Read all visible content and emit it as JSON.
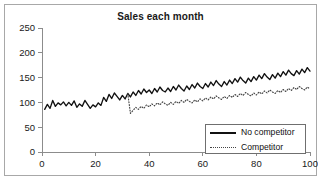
{
  "chart_data": {
    "type": "line",
    "title": "Sales each month",
    "xlabel": "",
    "ylabel": "",
    "xlim": [
      0,
      100
    ],
    "ylim": [
      0,
      250
    ],
    "xticks": [
      0,
      20,
      40,
      60,
      80,
      100
    ],
    "yticks": [
      0,
      50,
      100,
      150,
      200,
      250
    ],
    "grid": false,
    "legend_position": "bottom-right",
    "series": [
      {
        "name": "No competitor",
        "style": "solid",
        "color": "#111111",
        "x": [
          1,
          2,
          3,
          4,
          5,
          6,
          7,
          8,
          9,
          10,
          11,
          12,
          13,
          14,
          15,
          16,
          17,
          18,
          19,
          20,
          21,
          22,
          23,
          24,
          25,
          26,
          27,
          28,
          29,
          30,
          31,
          32,
          33,
          34,
          35,
          36,
          37,
          38,
          39,
          40,
          41,
          42,
          43,
          44,
          45,
          46,
          47,
          48,
          49,
          50,
          51,
          52,
          53,
          54,
          55,
          56,
          57,
          58,
          59,
          60,
          61,
          62,
          63,
          64,
          65,
          66,
          67,
          68,
          69,
          70,
          71,
          72,
          73,
          74,
          75,
          76,
          77,
          78,
          79,
          80,
          81,
          82,
          83,
          84,
          85,
          86,
          87,
          88,
          89,
          90,
          91,
          92,
          93,
          94,
          95,
          96,
          97,
          98,
          99,
          100
        ],
        "values": [
          86,
          96,
          88,
          104,
          92,
          99,
          95,
          101,
          93,
          100,
          94,
          103,
          90,
          97,
          92,
          104,
          96,
          88,
          95,
          91,
          99,
          94,
          110,
          102,
          116,
          108,
          119,
          112,
          105,
          114,
          107,
          118,
          111,
          121,
          114,
          124,
          117,
          127,
          120,
          125,
          118,
          128,
          121,
          131,
          124,
          121,
          129,
          122,
          132,
          125,
          135,
          128,
          123,
          133,
          126,
          136,
          129,
          139,
          132,
          128,
          138,
          131,
          141,
          134,
          144,
          137,
          132,
          142,
          135,
          145,
          138,
          148,
          141,
          151,
          144,
          139,
          149,
          142,
          152,
          145,
          155,
          148,
          158,
          151,
          146,
          156,
          149,
          159,
          152,
          162,
          155,
          165,
          158,
          154,
          164,
          157,
          167,
          160,
          170,
          163
        ],
        "value_note": "Upward-trending noisy monthly series; starts ~86 at month 1, ends ~235 at month 100"
      },
      {
        "name": "Competitor",
        "style": "dotted",
        "color": "#444444",
        "x": [
          32,
          33,
          34,
          35,
          36,
          37,
          38,
          39,
          40,
          41,
          42,
          43,
          44,
          45,
          46,
          47,
          48,
          49,
          50,
          51,
          52,
          53,
          54,
          55,
          56,
          57,
          58,
          59,
          60,
          61,
          62,
          63,
          64,
          65,
          66,
          67,
          68,
          69,
          70,
          71,
          72,
          73,
          74,
          75,
          76,
          77,
          78,
          79,
          80,
          81,
          82,
          83,
          84,
          85,
          86,
          87,
          88,
          89,
          90,
          91,
          92,
          93,
          94,
          95,
          96,
          97,
          98,
          99,
          100
        ],
        "values": [
          118,
          78,
          84,
          90,
          86,
          92,
          88,
          95,
          91,
          97,
          93,
          99,
          95,
          101,
          97,
          94,
          100,
          96,
          102,
          98,
          104,
          100,
          106,
          102,
          99,
          105,
          101,
          107,
          103,
          109,
          105,
          111,
          107,
          113,
          109,
          106,
          112,
          108,
          114,
          110,
          116,
          112,
          118,
          114,
          120,
          116,
          113,
          119,
          115,
          121,
          117,
          123,
          119,
          125,
          121,
          118,
          124,
          120,
          126,
          122,
          128,
          124,
          130,
          126,
          132,
          128,
          125,
          131,
          127
        ],
        "value_note": "Dotted series begins month 32 with a sharp drop to ~78, then trends up to ~163 at month 100"
      }
    ]
  },
  "legend": {
    "items": [
      {
        "label": "No competitor",
        "style": "solid"
      },
      {
        "label": "Competitor",
        "style": "dotted"
      }
    ]
  }
}
